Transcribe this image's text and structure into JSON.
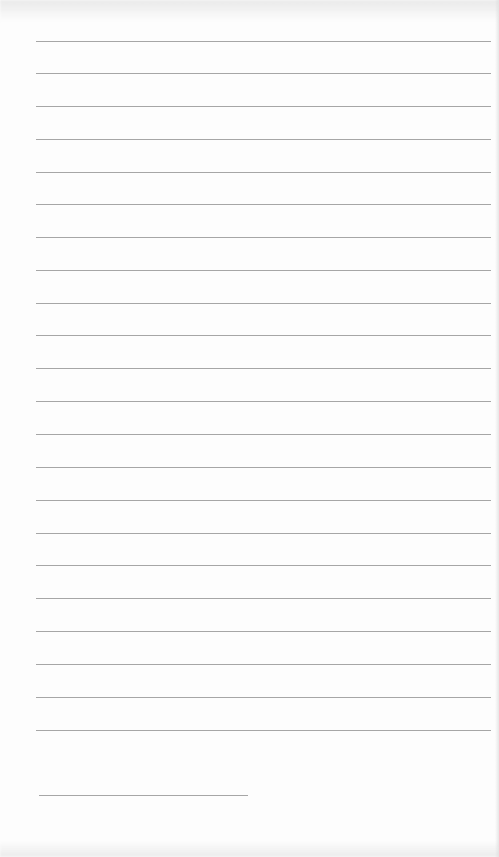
{
  "document": {
    "type": "ruled-paper-page",
    "background_color": "#fdfdfd",
    "rule_color": "#9c9c9c",
    "rules": [
      {
        "y": 41,
        "x1": 36,
        "x2": 491
      },
      {
        "y": 73,
        "x1": 36,
        "x2": 491
      },
      {
        "y": 106,
        "x1": 36,
        "x2": 491
      },
      {
        "y": 139,
        "x1": 36,
        "x2": 491
      },
      {
        "y": 172,
        "x1": 36,
        "x2": 491
      },
      {
        "y": 204,
        "x1": 36,
        "x2": 491
      },
      {
        "y": 237,
        "x1": 36,
        "x2": 491
      },
      {
        "y": 270,
        "x1": 36,
        "x2": 491
      },
      {
        "y": 303,
        "x1": 36,
        "x2": 491
      },
      {
        "y": 335,
        "x1": 36,
        "x2": 491
      },
      {
        "y": 368,
        "x1": 36,
        "x2": 491
      },
      {
        "y": 401,
        "x1": 36,
        "x2": 491
      },
      {
        "y": 434,
        "x1": 36,
        "x2": 491
      },
      {
        "y": 467,
        "x1": 36,
        "x2": 491
      },
      {
        "y": 500,
        "x1": 36,
        "x2": 491
      },
      {
        "y": 533,
        "x1": 36,
        "x2": 491
      },
      {
        "y": 565,
        "x1": 36,
        "x2": 491
      },
      {
        "y": 598,
        "x1": 36,
        "x2": 491
      },
      {
        "y": 631,
        "x1": 36,
        "x2": 491
      },
      {
        "y": 664,
        "x1": 36,
        "x2": 491
      },
      {
        "y": 697,
        "x1": 36,
        "x2": 491
      },
      {
        "y": 730,
        "x1": 36,
        "x2": 491
      }
    ],
    "short_rule": {
      "y": 795,
      "x1": 39,
      "x2": 248
    }
  }
}
